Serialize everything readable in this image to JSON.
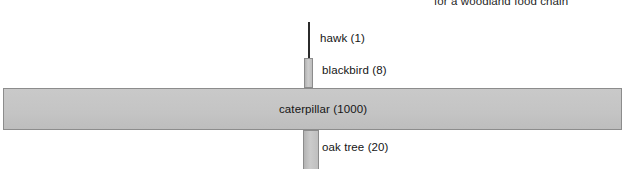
{
  "title_fragment": "for a woodland food chain",
  "chart_data": {
    "type": "bar",
    "title": "for a woodland food chain",
    "xlabel": "",
    "ylabel": "",
    "orientation": "horizontal-pyramid",
    "categories": [
      "hawk",
      "blackbird",
      "caterpillar",
      "oak tree"
    ],
    "values": [
      1,
      8,
      1000,
      20
    ],
    "labels": [
      "hawk (1)",
      "blackbird (8)",
      "caterpillar (1000)",
      "oak tree (20)"
    ],
    "levels": [
      {
        "name": "hawk",
        "count": 1,
        "label": "hawk (1)"
      },
      {
        "name": "blackbird",
        "count": 8,
        "label": "blackbird (8)"
      },
      {
        "name": "caterpillar",
        "count": 1000,
        "label": "caterpillar (1000)"
      },
      {
        "name": "oak tree",
        "count": 20,
        "label": "oak tree (20)"
      }
    ],
    "colors": {
      "bar_fill": "#c5c5c5",
      "bar_border": "#8c8c8c",
      "text": "#151515",
      "background": "#ffffff"
    },
    "grid": false,
    "legend": "none"
  }
}
